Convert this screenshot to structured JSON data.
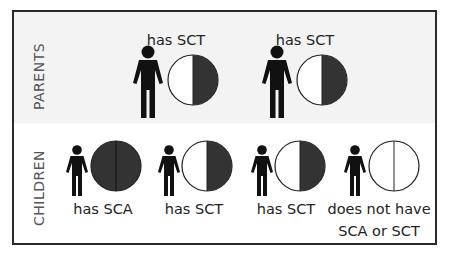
{
  "diagram": {
    "sections": {
      "parents": {
        "label": "PARENTS",
        "members": [
          {
            "label": "has SCT",
            "genotype": "half"
          },
          {
            "label": "has SCT",
            "genotype": "half"
          }
        ]
      },
      "children": {
        "label": "CHILDREN",
        "members": [
          {
            "label": "has SCA",
            "genotype": "full"
          },
          {
            "label": "has SCT",
            "genotype": "half"
          },
          {
            "label": "has SCT",
            "genotype": "half"
          },
          {
            "label_line1": "does not have",
            "label_line2": "SCA or SCT",
            "genotype": "none"
          }
        ]
      }
    },
    "colors": {
      "border": "#2a2a2a",
      "figure": "#111111",
      "allele_filled": "#333333",
      "allele_empty": "#ffffff",
      "parents_band": "#f3f3f3",
      "section_label": "#555555",
      "text": "#222222"
    }
  }
}
